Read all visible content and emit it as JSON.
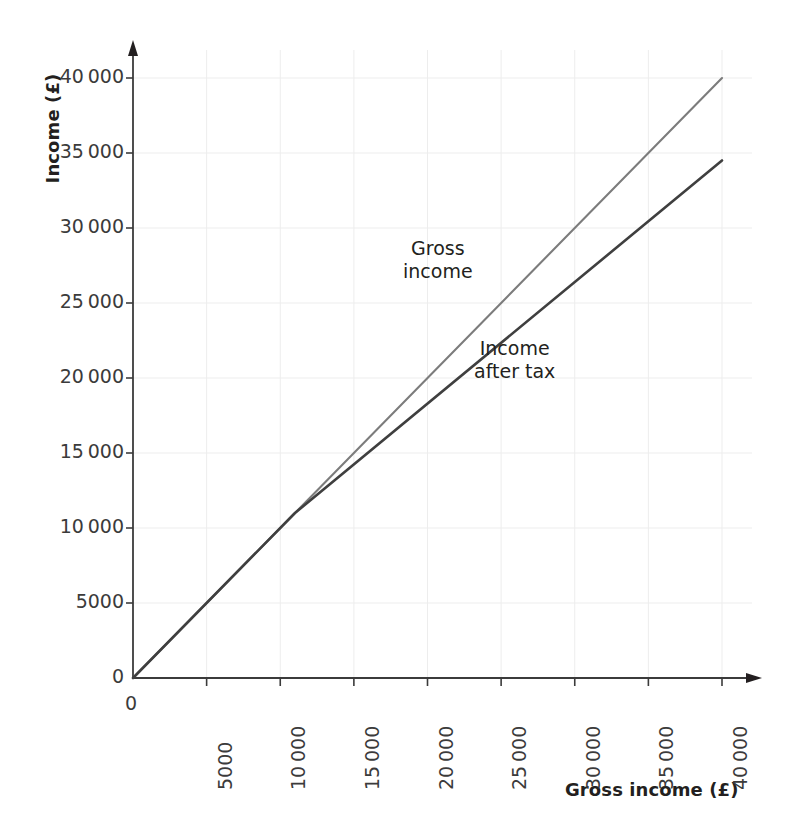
{
  "figure": {
    "top_cropped_text": "",
    "background": "#ffffff"
  },
  "axes": {
    "y_title": "Income (£)",
    "x_title": "Gross income (£)",
    "y_tick_labels": [
      "0",
      "5000",
      "10 000",
      "15 000",
      "20 000",
      "25 000",
      "30 000",
      "35 000",
      "40 000"
    ],
    "x_tick_labels": [
      "0",
      "5000",
      "10 000",
      "15 000",
      "20 000",
      "25 000",
      "30 000",
      "35 000",
      "40 000"
    ]
  },
  "annotations": {
    "gross_line_1": "Gross",
    "gross_line_2": "income",
    "net_line_1": "Income",
    "net_line_2": "after tax"
  },
  "colors": {
    "gross_line": "#7c7c7c",
    "net_line": "#3f3f3f",
    "axis": "#3b3b3b",
    "grid": "#ededed",
    "text": "#231f20"
  },
  "chart_data": {
    "type": "line",
    "title": "",
    "xlabel": "Gross income (£)",
    "ylabel": "Income (£)",
    "xlim": [
      0,
      40000
    ],
    "ylim": [
      0,
      40000
    ],
    "xticks": [
      0,
      5000,
      10000,
      15000,
      20000,
      25000,
      30000,
      35000,
      40000
    ],
    "yticks": [
      0,
      5000,
      10000,
      15000,
      20000,
      25000,
      30000,
      35000,
      40000
    ],
    "grid": true,
    "legend": "inline-annotations",
    "series": [
      {
        "name": "Gross income",
        "color": "#7c7c7c",
        "points": [
          [
            0,
            0
          ],
          [
            40000,
            40000
          ]
        ]
      },
      {
        "name": "Income after tax",
        "color": "#3f3f3f",
        "points": [
          [
            0,
            0
          ],
          [
            11000,
            11000
          ],
          [
            40000,
            34500
          ]
        ]
      }
    ]
  }
}
